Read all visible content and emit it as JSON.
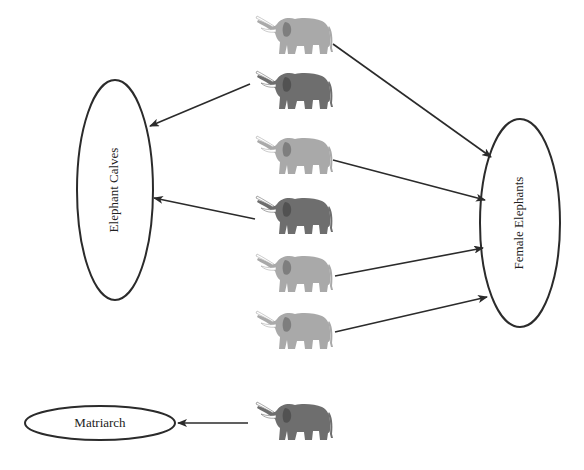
{
  "diagram": {
    "colors": {
      "background": "#ffffff",
      "stroke": "#2b2b2b",
      "elephant_light": "#a9a9a9",
      "elephant_dark": "#6e6e6e",
      "tusk": "#ffffff"
    },
    "nodes": {
      "calves": {
        "label": "Elephant Calves",
        "cx": 115,
        "cy": 190,
        "rx": 38,
        "ry": 110,
        "text_rotation": -90,
        "font_size": 13
      },
      "females": {
        "label": "Female Elephants",
        "cx": 520,
        "cy": 223,
        "rx": 40,
        "ry": 104,
        "text_rotation": -90,
        "font_size": 13
      },
      "matriarch": {
        "label": "Matriarch",
        "cx": 100,
        "cy": 423,
        "rx": 75,
        "ry": 17,
        "text_rotation": 0,
        "font_size": 13
      }
    },
    "elephants": [
      {
        "id": "e1",
        "shade": "light",
        "x": 255,
        "y": 15
      },
      {
        "id": "e2",
        "shade": "dark",
        "x": 255,
        "y": 70
      },
      {
        "id": "e3",
        "shade": "light",
        "x": 255,
        "y": 135
      },
      {
        "id": "e4",
        "shade": "dark",
        "x": 255,
        "y": 195
      },
      {
        "id": "e5",
        "shade": "light",
        "x": 255,
        "y": 253
      },
      {
        "id": "e6",
        "shade": "light",
        "x": 255,
        "y": 310
      },
      {
        "id": "e7",
        "shade": "dark",
        "x": 255,
        "y": 403
      }
    ],
    "edges": [
      {
        "from": "e1",
        "to": "females",
        "x1": 333,
        "y1": 44,
        "x2": 491,
        "y2": 157
      },
      {
        "from": "e2",
        "to": "calves",
        "x1": 250,
        "y1": 84,
        "x2": 150,
        "y2": 126
      },
      {
        "from": "e3",
        "to": "females",
        "x1": 333,
        "y1": 160,
        "x2": 485,
        "y2": 200
      },
      {
        "from": "e4",
        "to": "calves",
        "x1": 255,
        "y1": 219,
        "x2": 154,
        "y2": 198
      },
      {
        "from": "e5",
        "to": "females",
        "x1": 335,
        "y1": 276,
        "x2": 483,
        "y2": 248
      },
      {
        "from": "e6",
        "to": "females",
        "x1": 335,
        "y1": 332,
        "x2": 487,
        "y2": 297
      },
      {
        "from": "e7",
        "to": "matriarch",
        "x1": 248,
        "y1": 423,
        "x2": 178,
        "y2": 423
      }
    ]
  }
}
